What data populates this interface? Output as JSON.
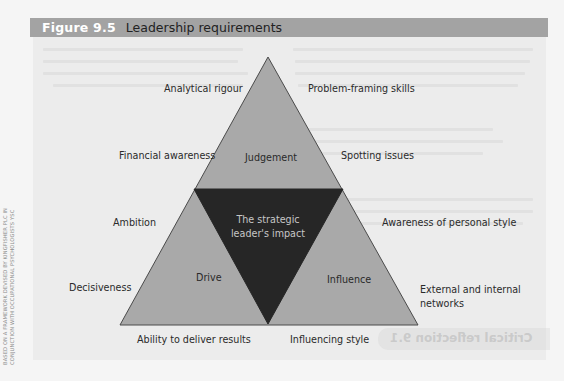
{
  "figure": {
    "number": "Figure 9.5",
    "title": "Leadership requirements",
    "credit_line_1": "Based on a framework devised by Kingfisher PLC in",
    "credit_line_2": "conjunction with occupational psychologists YSC"
  },
  "diagram": {
    "center": {
      "line1": "The strategic",
      "line2": "leader's impact"
    },
    "segments": {
      "top": "Judgement",
      "bottom_left": "Drive",
      "bottom_right": "Influence"
    },
    "outer_labels": {
      "analytical_rigour": "Analytical rigour",
      "problem_framing": "Problem-framing skills",
      "financial_awareness": "Financial awareness",
      "spotting_issues": "Spotting issues",
      "ambition": "Ambition",
      "awareness_personal_style": "Awareness of personal style",
      "decisiveness": "Decisiveness",
      "external_internal_line1": "External and internal",
      "external_internal_line2": "networks",
      "ability_deliver": "Ability to deliver results",
      "influencing_style": "Influencing style"
    },
    "colors": {
      "outer_fill": "#a9a9a9",
      "outer_stroke": "#4a4a4a",
      "inner_fill": "#262626",
      "inner_text": "#c6c6c6",
      "header_bar": "#a3a3a3"
    }
  },
  "bleed_through": {
    "text": "Critical reflection 9.1"
  }
}
